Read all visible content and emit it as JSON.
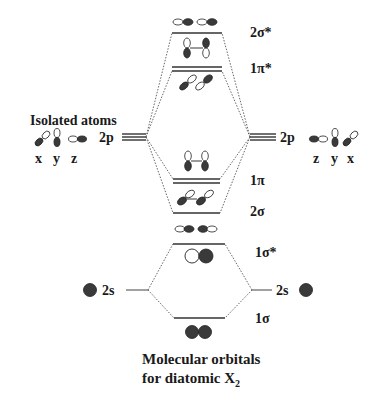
{
  "diagram": {
    "title_line1": "Molecular orbitals",
    "title_line2_prefix": "for diatomic X",
    "title_line2_sub": "2",
    "left_header": "Isolated atoms",
    "left_atom": {
      "p_label": "2p",
      "s_label": "2s",
      "axes": [
        "x",
        "y",
        "z"
      ]
    },
    "right_atom": {
      "p_label": "2p",
      "s_label": "2s",
      "axes": [
        "z",
        "y",
        "x"
      ]
    },
    "mo_levels": [
      {
        "label": "2σ*",
        "type": "antibonding",
        "degenerate": 1
      },
      {
        "label": "1π*",
        "type": "antibonding",
        "degenerate": 2
      },
      {
        "label": "1π",
        "type": "bonding",
        "degenerate": 2
      },
      {
        "label": "2σ",
        "type": "bonding",
        "degenerate": 1
      },
      {
        "label": "1σ*",
        "type": "antibonding",
        "degenerate": 1
      },
      {
        "label": "1σ",
        "type": "bonding",
        "degenerate": 1
      }
    ],
    "colors": {
      "lines": "#333333",
      "lobe_dark": "#3a3a3a",
      "background": "#ffffff"
    }
  }
}
